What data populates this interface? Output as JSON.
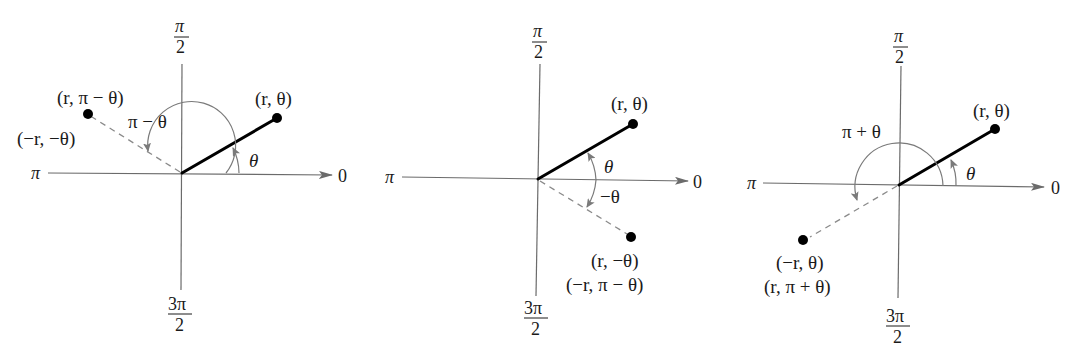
{
  "figure": {
    "colors": {
      "axis": "#6b6b6b",
      "ray": "#000000",
      "dashed": "#8a8a8a",
      "arc": "#7a7a7a",
      "background": "#ffffff"
    },
    "axis_labels": {
      "right": "0",
      "left": "π",
      "top_num": "π",
      "top_den": "2",
      "bottom_num": "3π",
      "bottom_den": "2"
    },
    "panels": [
      {
        "id": "reflection-about-vertical",
        "point_label": "(r, θ)",
        "image_label_line1": "(r, π − θ)",
        "image_label_line2": "(−r, −θ)",
        "angle_label_main": "θ",
        "angle_label_image": "π − θ"
      },
      {
        "id": "reflection-about-polar-axis",
        "point_label": "(r, θ)",
        "image_label_line1": "(r, −θ)",
        "image_label_line2": "(−r, π − θ)",
        "angle_label_main": "θ",
        "angle_label_image": "−θ"
      },
      {
        "id": "reflection-about-pole",
        "point_label": "(r, θ)",
        "image_label_line1": "(−r, θ)",
        "image_label_line2": "(r, π + θ)",
        "angle_label_main": "θ",
        "angle_label_image": "π + θ"
      }
    ]
  }
}
